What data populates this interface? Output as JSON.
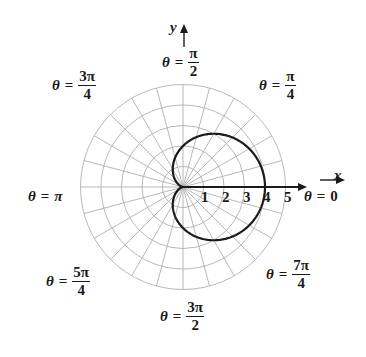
{
  "chart_data": {
    "type": "polar",
    "title": "",
    "curve": {
      "equation": "r = 2 + 2cos(theta)",
      "shape": "cardioid",
      "max_r": 4,
      "color": "#1a1a1a"
    },
    "grid": {
      "radial_circles": [
        1,
        2,
        3,
        4,
        5
      ],
      "ray_step_degrees": 15,
      "color": "#b0b0b0"
    },
    "r_tick_labels": [
      "1",
      "2",
      "3",
      "4",
      "5"
    ],
    "axes": {
      "x_label": "x",
      "y_label": "y"
    },
    "angle_labels": [
      {
        "id": "zero",
        "theta": "θ",
        "eq": "=",
        "value": "0"
      },
      {
        "id": "pi4",
        "theta": "θ",
        "eq": "=",
        "num": "π",
        "den": "4"
      },
      {
        "id": "pi2",
        "theta": "θ",
        "eq": "=",
        "num": "π",
        "den": "2"
      },
      {
        "id": "3pi4",
        "theta": "θ",
        "eq": "=",
        "num": "3π",
        "den": "4"
      },
      {
        "id": "pi",
        "theta": "θ",
        "eq": "=",
        "value": "π"
      },
      {
        "id": "5pi4",
        "theta": "θ",
        "eq": "=",
        "num": "5π",
        "den": "4"
      },
      {
        "id": "3pi2",
        "theta": "θ",
        "eq": "=",
        "num": "3π",
        "den": "2"
      },
      {
        "id": "7pi4",
        "theta": "θ",
        "eq": "=",
        "num": "7π",
        "den": "4"
      }
    ]
  },
  "layout": {
    "cx": 183,
    "cy": 187,
    "unit_px": 20.5
  }
}
